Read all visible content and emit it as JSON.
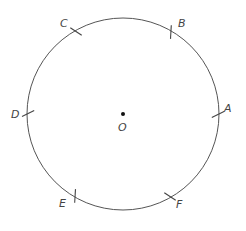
{
  "diagram": {
    "title": "",
    "center": {
      "label": "O"
    },
    "points": [
      {
        "label": "A",
        "angle_deg": 0
      },
      {
        "label": "B",
        "angle_deg": 60
      },
      {
        "label": "C",
        "angle_deg": 120
      },
      {
        "label": "D",
        "angle_deg": 180
      },
      {
        "label": "E",
        "angle_deg": 240
      },
      {
        "label": "F",
        "angle_deg": 300
      }
    ],
    "colors": {
      "stroke": "#555555",
      "text": "#444444",
      "background": "#ffffff"
    }
  }
}
